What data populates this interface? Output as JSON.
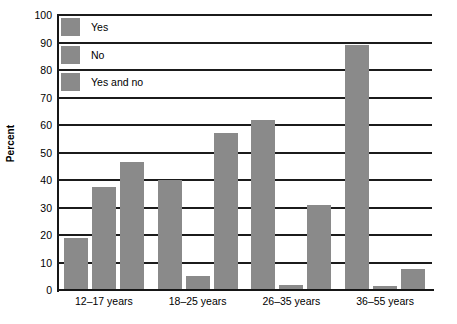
{
  "chart_data": {
    "type": "bar",
    "title": "",
    "subtitle": "",
    "xlabel": "",
    "ylabel": "Percent",
    "ylim": [
      0,
      100
    ],
    "ytick_step": 10,
    "yticks": [
      0,
      10,
      20,
      30,
      40,
      50,
      60,
      70,
      80,
      90,
      100
    ],
    "ytick_labels": [
      "0",
      "10",
      "20",
      "30",
      "40",
      "50",
      "60",
      "70",
      "80",
      "90",
      "100"
    ],
    "grid": "horizontal",
    "legend_position": "top-left-inside",
    "bar_color": "#8a8a8a",
    "axis_color": "#161616",
    "categories": [
      "12–17 years",
      "18–25 years",
      "26–35 years",
      "36–55 years"
    ],
    "series": [
      {
        "name": "Yes",
        "values": [
          19,
          40,
          62,
          89
        ]
      },
      {
        "name": "No",
        "values": [
          37.5,
          5,
          2,
          1.5
        ]
      },
      {
        "name": "Yes and no",
        "values": [
          46.5,
          57,
          31,
          7.5
        ]
      }
    ]
  },
  "legend": {
    "items": [
      {
        "label": "Yes"
      },
      {
        "label": "No"
      },
      {
        "label": "Yes and no"
      }
    ]
  }
}
